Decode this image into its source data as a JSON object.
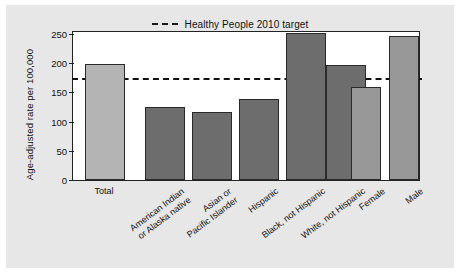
{
  "figure": {
    "background_color": "#e7e7e7",
    "plot_background_color": "#ffffff"
  },
  "legend": {
    "position": "top-center",
    "entries": [
      {
        "label": "Healthy People 2010 target",
        "style": "dashed-line",
        "color": "#1a1a1a"
      }
    ]
  },
  "axes": {
    "ylabel": "Age-adjusted rate per 100,000",
    "xlabel": "",
    "yticks": [
      "0",
      "50",
      "100",
      "150",
      "200",
      "250"
    ]
  },
  "chart_data": {
    "type": "bar",
    "title": "",
    "subtitle": "",
    "xlabel": "",
    "ylabel": "Age-adjusted rate per 100,000",
    "ylim": [
      0,
      250
    ],
    "yticks": [
      0,
      50,
      100,
      150,
      200,
      250
    ],
    "grid": false,
    "legend_position": "top-center",
    "categories": [
      "Total",
      "American Indian\nor Alaska native",
      "Asian or\nPacific Islander",
      "Hispanic",
      "Black, not Hispanic",
      "White, not Hispanic",
      "Female",
      "Male"
    ],
    "values": [
      197,
      124,
      116,
      138,
      250,
      196,
      158,
      246
    ],
    "bar_colors": [
      "#b4b4b4",
      "#6d6d6d",
      "#6d6d6d",
      "#6d6d6d",
      "#6d6d6d",
      "#6d6d6d",
      "#989898",
      "#989898"
    ],
    "bar_groups": [
      "overall",
      "race-ethnicity",
      "race-ethnicity",
      "race-ethnicity",
      "race-ethnicity",
      "race-ethnicity",
      "sex",
      "sex"
    ],
    "annotations": [
      {
        "type": "hline",
        "label": "Healthy People 2010 target",
        "value": 170,
        "style": "dashed",
        "color": "#1a1a1a"
      }
    ]
  }
}
